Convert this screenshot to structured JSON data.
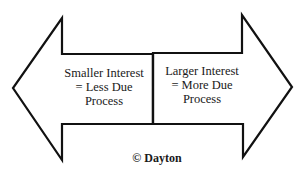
{
  "diagram": {
    "type": "double-arrow",
    "left_arrow": {
      "direction": "left",
      "lines": [
        "Smaller Interest",
        "= Less Due",
        "Process"
      ]
    },
    "right_arrow": {
      "direction": "right",
      "lines": [
        "Larger Interest",
        "= More Due",
        "Process"
      ]
    },
    "colors": {
      "stroke": "#111111",
      "fill": "#ffffff",
      "text": "#1a1a1a"
    }
  },
  "footer": {
    "copyright": "© Dayton"
  }
}
